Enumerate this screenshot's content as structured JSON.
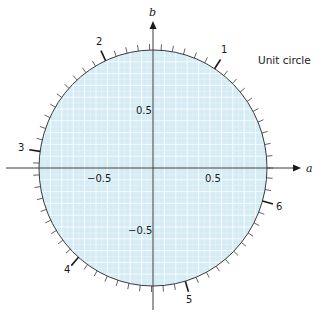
{
  "title": "Unit circle",
  "axes": {
    "x_label": "a",
    "y_label": "b",
    "x_ticks": [
      "−0.5",
      "0.5"
    ],
    "y_ticks": [
      "0.5",
      "−0.5"
    ]
  },
  "angle_markers": [
    "1",
    "2",
    "3",
    "4",
    "5",
    "6"
  ],
  "colors": {
    "fill": "#d6ecf5",
    "grid": "#ffffff",
    "stroke": "#3a3a3a"
  },
  "chart_data": {
    "type": "diagram",
    "title": "Unit circle",
    "xlabel": "a",
    "ylabel": "b",
    "xlim": [
      -1.2,
      1.2
    ],
    "ylim": [
      -1.1,
      1.1
    ],
    "circle": {
      "center": [
        0,
        0
      ],
      "radius": 1
    },
    "x_tick_labels": [
      -0.5,
      0.5
    ],
    "y_tick_labels": [
      0.5,
      -0.5
    ],
    "angle_tick_spacing_rad": 0.1,
    "major_angle_labels_rad": [
      1,
      2,
      3,
      4,
      5,
      6
    ],
    "grid": true
  }
}
